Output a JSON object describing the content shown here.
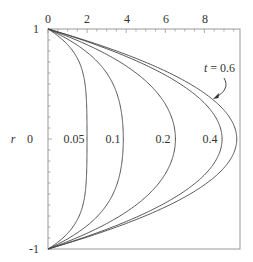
{
  "chart_data": {
    "type": "line",
    "title": "",
    "xlabel": "",
    "ylabel": "r",
    "x_axis_position": "top",
    "xlim": [
      0,
      9.85
    ],
    "ylim": [
      -1,
      1
    ],
    "x_ticks": [
      0,
      2,
      4,
      6,
      8
    ],
    "x_tick_labels": [
      "0",
      "2",
      "4",
      "6",
      "8"
    ],
    "y_ticks": [
      1,
      0,
      -1
    ],
    "y_tick_labels": [
      "1",
      "0",
      "-1"
    ],
    "grid": false,
    "legend": "none",
    "model": "u(r,t) = 10(1 - r^2) - sum 80 J0(λn r)/(λn^3 J1(λn)) exp(-λn^2 t)",
    "steady_max": 10,
    "series": [
      {
        "name": "0.05",
        "t": 0.05,
        "centerline_value": 2.0,
        "r": [
          1,
          0.8,
          0.6,
          0.4,
          0.2,
          0,
          -0.2,
          -0.4,
          -0.6,
          -0.8,
          -1
        ],
        "values": [
          0,
          1.45,
          1.93,
          1.99,
          2.0,
          2.0,
          2.0,
          1.99,
          1.93,
          1.45,
          0
        ]
      },
      {
        "name": "0.1",
        "t": 0.1,
        "centerline_value": 3.85,
        "r": [
          1,
          0.8,
          0.6,
          0.4,
          0.2,
          0,
          -0.2,
          -0.4,
          -0.6,
          -0.8,
          -1
        ],
        "values": [
          0,
          2.4,
          3.45,
          3.78,
          3.85,
          3.86,
          3.85,
          3.78,
          3.45,
          2.4,
          0
        ]
      },
      {
        "name": "0.2",
        "t": 0.2,
        "centerline_value": 6.4,
        "r": [
          1,
          0.8,
          0.6,
          0.4,
          0.2,
          0,
          -0.2,
          -0.4,
          -0.6,
          -0.8,
          -1
        ],
        "values": [
          0,
          3.3,
          5.1,
          6.0,
          6.35,
          6.45,
          6.35,
          6.0,
          5.1,
          3.3,
          0
        ]
      },
      {
        "name": "0.4",
        "t": 0.4,
        "centerline_value": 8.8,
        "r": [
          1,
          0.8,
          0.6,
          0.4,
          0.2,
          0,
          -0.2,
          -0.4,
          -0.6,
          -0.8,
          -1
        ],
        "values": [
          0,
          3.5,
          6.2,
          7.9,
          8.6,
          8.8,
          8.6,
          7.9,
          6.2,
          3.5,
          0
        ]
      },
      {
        "name": "t = 0.6",
        "t": 0.6,
        "centerline_value": 9.65,
        "r": [
          1,
          0.8,
          0.6,
          0.4,
          0.2,
          0,
          -0.2,
          -0.4,
          -0.6,
          -0.8,
          -1
        ],
        "values": [
          0,
          3.6,
          6.5,
          8.45,
          9.3,
          9.65,
          9.3,
          8.45,
          6.5,
          3.6,
          0
        ]
      }
    ],
    "annotations": [
      {
        "text": "t = 0.6",
        "arrow_to_series": "t = 0.6"
      }
    ]
  },
  "labels": {
    "y_axis": "r",
    "y_top": "1",
    "y_mid": "0",
    "y_bottom": "-1",
    "x_ticks": [
      "0",
      "2",
      "4",
      "6",
      "8"
    ],
    "curve_labels": [
      "0.05",
      "0.1",
      "0.2",
      "0.4"
    ],
    "annotation_t": "t",
    "annotation_eq": " = 0.6"
  }
}
